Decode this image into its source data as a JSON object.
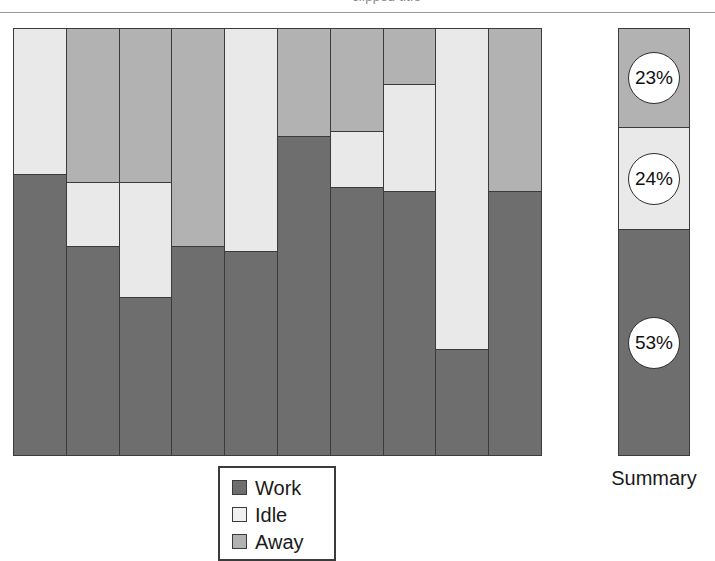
{
  "header": {
    "cropped_text": "clipped title"
  },
  "chart_data": {
    "type": "bar",
    "title": "",
    "subtitle": "",
    "xlabel": "",
    "ylabel": "",
    "stacked": true,
    "normalized": true,
    "ylim": [
      0,
      100
    ],
    "grid": false,
    "legend_position": "bottom-center",
    "series_order": [
      "Away",
      "Idle",
      "Work"
    ],
    "colors": {
      "work": "#6e6e6e",
      "idle": "#e9e9e9",
      "away": "#b2b2b2",
      "outline": "#3b3b3b"
    },
    "legend": [
      {
        "key": "work",
        "label": "Work",
        "color": "#6e6e6e"
      },
      {
        "key": "idle",
        "label": "Idle",
        "color": "#f0f0f0"
      },
      {
        "key": "away",
        "label": "Away",
        "color": "#b2b2b2"
      }
    ],
    "categories": [
      "1",
      "2",
      "3",
      "4",
      "5",
      "6",
      "7",
      "8",
      "9",
      "10"
    ],
    "series": [
      {
        "name": "Away",
        "values": [
          0,
          36,
          36,
          51,
          0,
          25,
          24,
          13,
          0,
          38
        ]
      },
      {
        "name": "Idle",
        "values": [
          34,
          15,
          27,
          0,
          52,
          0,
          13,
          25,
          75,
          0
        ]
      },
      {
        "name": "Work",
        "values": [
          66,
          49,
          37,
          49,
          48,
          75,
          63,
          62,
          25,
          62
        ]
      }
    ],
    "bars": [
      {
        "category": "1",
        "segments": [
          {
            "key": "idle",
            "value": 34
          },
          {
            "key": "work",
            "value": 66
          }
        ]
      },
      {
        "category": "2",
        "segments": [
          {
            "key": "away",
            "value": 36
          },
          {
            "key": "idle",
            "value": 15
          },
          {
            "key": "work",
            "value": 49
          }
        ]
      },
      {
        "category": "3",
        "segments": [
          {
            "key": "away",
            "value": 36
          },
          {
            "key": "idle",
            "value": 27
          },
          {
            "key": "work",
            "value": 37
          }
        ]
      },
      {
        "category": "4",
        "segments": [
          {
            "key": "away",
            "value": 51
          },
          {
            "key": "work",
            "value": 49
          }
        ]
      },
      {
        "category": "5",
        "segments": [
          {
            "key": "idle",
            "value": 52
          },
          {
            "key": "work",
            "value": 48
          }
        ]
      },
      {
        "category": "6",
        "segments": [
          {
            "key": "away",
            "value": 25
          },
          {
            "key": "work",
            "value": 75
          }
        ]
      },
      {
        "category": "7",
        "segments": [
          {
            "key": "away",
            "value": 24
          },
          {
            "key": "idle",
            "value": 13
          },
          {
            "key": "work",
            "value": 63
          }
        ]
      },
      {
        "category": "8",
        "segments": [
          {
            "key": "away",
            "value": 13
          },
          {
            "key": "idle",
            "value": 25
          },
          {
            "key": "work",
            "value": 62
          }
        ]
      },
      {
        "category": "9",
        "segments": [
          {
            "key": "idle",
            "value": 75
          },
          {
            "key": "work",
            "value": 25
          }
        ]
      },
      {
        "category": "10",
        "segments": [
          {
            "key": "away",
            "value": 38
          },
          {
            "key": "work",
            "value": 62
          }
        ]
      }
    ],
    "summary": {
      "label": "Summary",
      "segments": [
        {
          "key": "away",
          "label": "23%",
          "value": 23
        },
        {
          "key": "idle",
          "label": "24%",
          "value": 24
        },
        {
          "key": "work",
          "label": "53%",
          "value": 53
        }
      ]
    }
  }
}
